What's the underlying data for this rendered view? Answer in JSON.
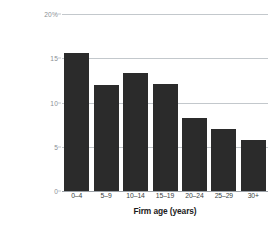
{
  "chart_data": {
    "type": "bar",
    "title": "",
    "xlabel": "Firm age (years)",
    "ylabel": "% of companies that say they're\nusing cloud computing",
    "categories": [
      "0–4",
      "5–9",
      "10–14",
      "15–19",
      "20–24",
      "25–29",
      "30+"
    ],
    "values": [
      15.6,
      12.0,
      13.3,
      12.1,
      8.2,
      7.0,
      5.8
    ],
    "ylim": [
      0,
      20
    ],
    "yticks": [
      0,
      5,
      10,
      15,
      20
    ],
    "ytick_labels": [
      "0",
      "5",
      "10",
      "15",
      "20%"
    ],
    "grid": true,
    "legend": "none",
    "bar_color": "#2b2b2b",
    "gridline_color": "#c3c8cc",
    "background_color": "#ffffff"
  }
}
